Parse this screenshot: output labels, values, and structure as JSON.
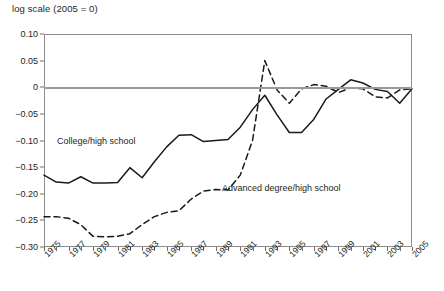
{
  "chart_data": {
    "type": "line",
    "title": "log scale (2005 = 0)",
    "xlabel": "",
    "ylabel": "",
    "ylim": [
      -0.3,
      0.1
    ],
    "xlim": [
      1975,
      2005
    ],
    "grid": false,
    "legend_position": "inline-annotation",
    "yticks": [
      "0.10",
      "0.05",
      "0",
      "−0.05",
      "−0.10",
      "−0.15",
      "−0.20",
      "−0.25",
      "−0.30"
    ],
    "ytick_values": [
      0.1,
      0.05,
      0,
      -0.05,
      -0.1,
      -0.15,
      -0.2,
      -0.25,
      -0.3
    ],
    "xticks": [
      "1975",
      "1977",
      "1979",
      "1981",
      "1983",
      "1985",
      "1987",
      "1989",
      "1991",
      "1993",
      "1995",
      "1997",
      "1999",
      "2001",
      "2003",
      "2005"
    ],
    "x": [
      1975,
      1976,
      1977,
      1978,
      1979,
      1980,
      1981,
      1982,
      1983,
      1984,
      1985,
      1986,
      1987,
      1988,
      1989,
      1990,
      1991,
      1992,
      1993,
      1994,
      1995,
      1996,
      1997,
      1998,
      1999,
      2000,
      2001,
      2002,
      2003,
      2004,
      2005
    ],
    "series": [
      {
        "name": "College/high school",
        "style": "solid",
        "color": "#1a1a1a",
        "values": [
          -0.165,
          -0.178,
          -0.18,
          -0.168,
          -0.18,
          -0.18,
          -0.179,
          -0.151,
          -0.17,
          -0.14,
          -0.112,
          -0.09,
          -0.089,
          -0.102,
          -0.1,
          -0.098,
          -0.075,
          -0.042,
          -0.015,
          -0.052,
          -0.085,
          -0.085,
          -0.06,
          -0.022,
          -0.004,
          0.014,
          0.008,
          -0.004,
          -0.008,
          -0.03,
          -0.003
        ]
      },
      {
        "name": "Advanced degree/high school",
        "style": "dashed",
        "color": "#1a1a1a",
        "values": [
          -0.243,
          -0.243,
          -0.246,
          -0.258,
          -0.28,
          -0.281,
          -0.28,
          -0.275,
          -0.258,
          -0.243,
          -0.235,
          -0.232,
          -0.21,
          -0.195,
          -0.192,
          -0.193,
          -0.165,
          -0.1,
          0.05,
          -0.005,
          -0.03,
          -0.003,
          0.005,
          0.002,
          -0.01,
          -0.001,
          -0.003,
          -0.018,
          -0.02,
          -0.005,
          -0.003
        ]
      }
    ]
  },
  "annotations": {
    "college_label": "College/high school",
    "advanced_label": "Advanced degree/high school"
  }
}
